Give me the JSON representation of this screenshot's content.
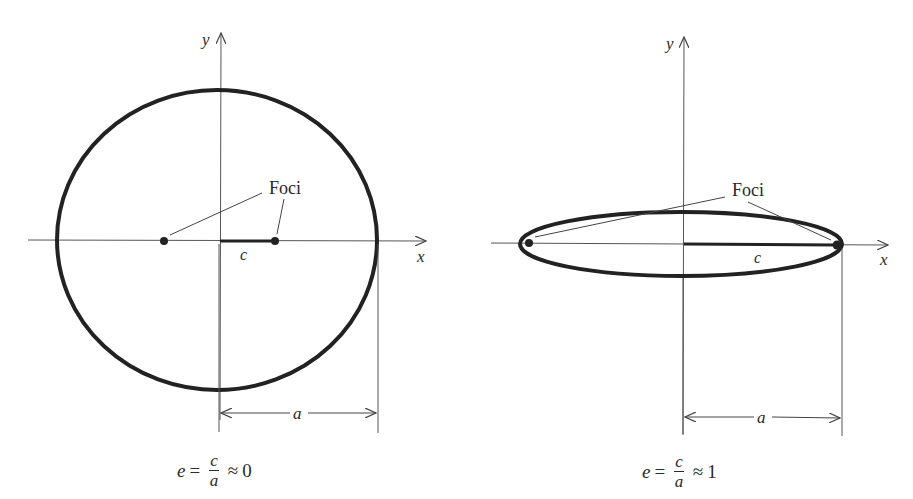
{
  "left_panel": {
    "title": "Nearly circular ellipse",
    "axis_x_label": "x",
    "axis_y_label": "y",
    "foci_label": "Foci",
    "c_label": "c",
    "a_label": "a",
    "formula": {
      "lhs": "e",
      "eq": "=",
      "num": "c",
      "den": "a",
      "approx": "≈",
      "value": "0"
    }
  },
  "right_panel": {
    "title": "Highly elongated ellipse",
    "axis_x_label": "x",
    "axis_y_label": "y",
    "foci_label": "Foci",
    "c_label": "c",
    "a_label": "a",
    "formula": {
      "lhs": "e",
      "eq": "=",
      "num": "c",
      "den": "a",
      "approx": "≈",
      "value": "1"
    }
  },
  "colors": {
    "stroke": "#222222",
    "axis": "#555555",
    "background": "#ffffff"
  }
}
